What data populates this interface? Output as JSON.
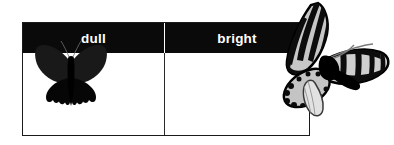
{
  "figure": {
    "name": "dull-vs-bright-butterfly-comparison",
    "background_color": "#ffffff"
  },
  "table": {
    "border_color": "#1a1a1a",
    "header_background": "#0a0a0a",
    "header_text_color": "#ffffff",
    "columns": [
      {
        "key": "dull",
        "label": "dull",
        "image": {
          "name": "dull-butterfly-image",
          "subject": "butterfly",
          "description": "dark swallowtail butterfly with wings spread, uniformly black-brown coloration",
          "colors": [
            "#000000",
            "#1c1c1c",
            "#3a3a3a"
          ]
        }
      },
      {
        "key": "bright",
        "label": "bright",
        "image": {
          "name": "bright-butterfly-image",
          "subject": "butterfly",
          "description": "boldly patterned butterfly with pale cream wings, black veins, black border spots and dark body",
          "colors": [
            "#000000",
            "#c9c9c9",
            "#e8e8e8",
            "#ffffff"
          ]
        }
      }
    ]
  }
}
